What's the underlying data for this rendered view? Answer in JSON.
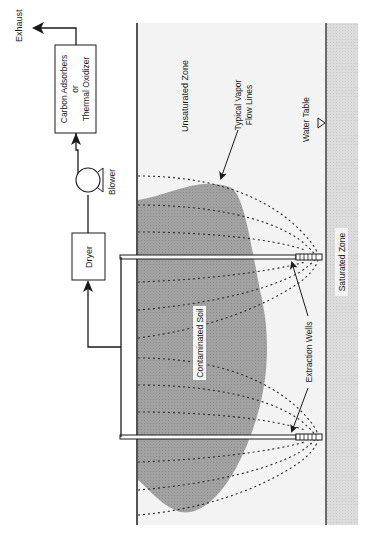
{
  "diagram": {
    "labels": {
      "exhaust": "Exhaust",
      "treatment_line1": "Carbon Adsorbers",
      "treatment_line2": "or",
      "treatment_line3": "Thermal Oxidizer",
      "blower": "Blower",
      "dryer": "Dryer",
      "unsaturated_zone": "Unsaturated Zone",
      "vapor_lines_line1": "Typical Vapor",
      "vapor_lines_line2": "Flow Lines",
      "water_table": "Water Table",
      "contaminated_soil": "Contaminated Soil",
      "extraction_wells": "Extraction Wells",
      "saturated_zone": "Saturated Zone"
    },
    "icons": {
      "water_table_marker": "triangle-down-icon",
      "blower": "blower-fan-icon"
    },
    "colors": {
      "line": "#1a1a1a",
      "contamination": "#9a9a9a",
      "unsaturated": "#f1f1f1",
      "saturated": "#d9d9d9",
      "flow_line": "#333333"
    }
  }
}
